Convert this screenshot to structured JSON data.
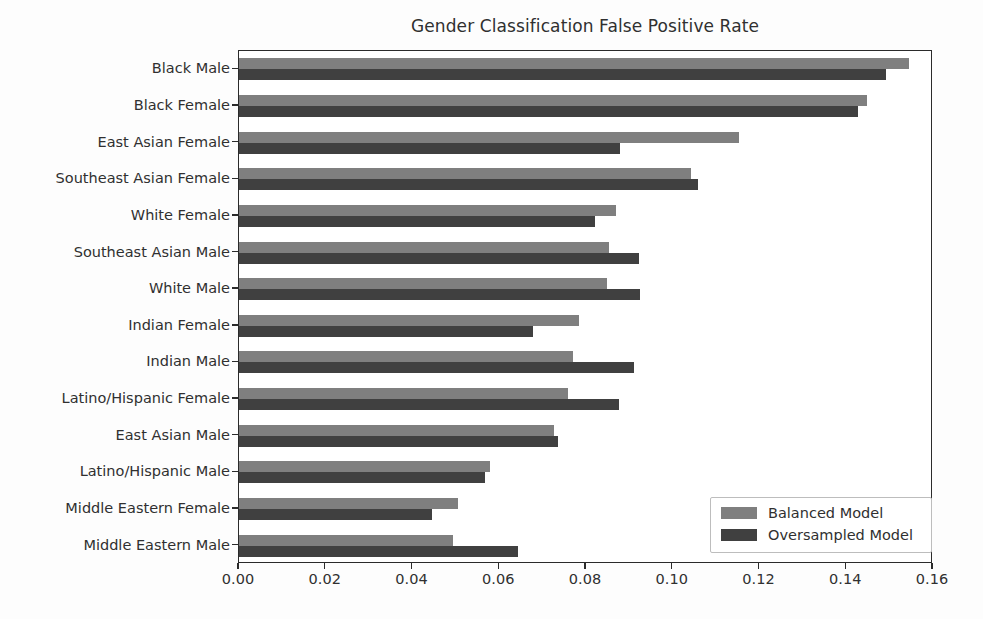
{
  "chart_data": {
    "type": "bar",
    "orientation": "horizontal",
    "title": "Gender Classification False Positive Rate",
    "xlabel": "",
    "ylabel": "",
    "xlim": [
      0.0,
      0.16
    ],
    "grid": false,
    "legend_position": "lower right",
    "xticks": [
      "0.00",
      "0.02",
      "0.04",
      "0.06",
      "0.08",
      "0.10",
      "0.12",
      "0.14",
      "0.16"
    ],
    "xtick_values": [
      0.0,
      0.02,
      0.04,
      0.06,
      0.08,
      0.1,
      0.12,
      0.14,
      0.16
    ],
    "categories": [
      "Black Male",
      "Black Female",
      "East Asian Female",
      "Southeast Asian Female",
      "White Female",
      "Southeast Asian Male",
      "White Male",
      "Indian Female",
      "Indian Male",
      "Latino/Hispanic Female",
      "East Asian Male",
      "Latino/Hispanic Male",
      "Middle Eastern Female",
      "Middle Eastern Male"
    ],
    "series": [
      {
        "name": "Balanced Model",
        "color": "#7f7f7f",
        "values": [
          0.1545,
          0.1448,
          0.1152,
          0.1042,
          0.0869,
          0.0852,
          0.0849,
          0.0784,
          0.077,
          0.0758,
          0.0726,
          0.0578,
          0.0505,
          0.0493
        ]
      },
      {
        "name": "Oversampled Model",
        "color": "#404040",
        "values": [
          0.1492,
          0.1427,
          0.0879,
          0.1058,
          0.0821,
          0.0923,
          0.0925,
          0.0678,
          0.0911,
          0.0876,
          0.0735,
          0.0567,
          0.0445,
          0.0643
        ]
      }
    ]
  },
  "legend": {
    "items": [
      {
        "label": "Balanced Model",
        "swatch": "legend-swatch-balanced"
      },
      {
        "label": "Oversampled Model",
        "swatch": "legend-swatch-oversampled"
      }
    ]
  }
}
